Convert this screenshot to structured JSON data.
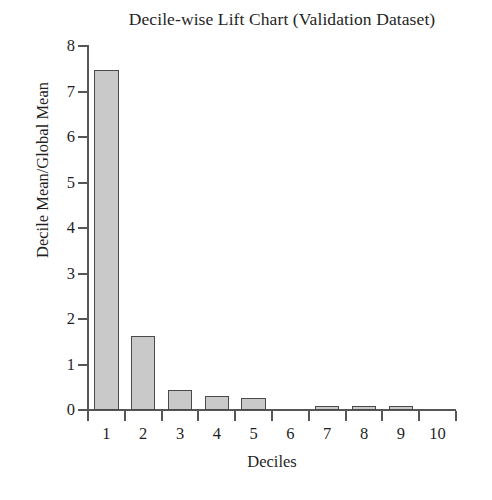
{
  "chart_data": {
    "type": "bar",
    "title": "Decile-wise Lift Chart (Validation Dataset)",
    "xlabel": "Deciles",
    "ylabel": "Decile Mean/Global Mean",
    "categories": [
      "1",
      "2",
      "3",
      "4",
      "5",
      "6",
      "7",
      "8",
      "9",
      "10"
    ],
    "values": [
      7.47,
      1.63,
      0.43,
      0.3,
      0.27,
      0.0,
      0.08,
      0.08,
      0.09,
      0.0
    ],
    "ylim": [
      0,
      8
    ],
    "yticks": [
      0,
      1,
      2,
      3,
      4,
      5,
      6,
      7,
      8
    ],
    "ytick_labels": [
      "0",
      "1",
      "2",
      "3",
      "4",
      "5",
      "6",
      "7",
      "8"
    ],
    "grid": false,
    "legend": false,
    "bar_fill_color": "#c9c9c9",
    "bar_edge_color": "#4a4a4a",
    "axis_color": "#565656",
    "text_color": "#1f1f1f",
    "background_color": "#ffffff"
  }
}
